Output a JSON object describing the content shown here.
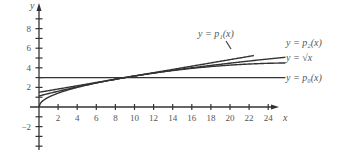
{
  "chart_data": {
    "type": "line",
    "title": "",
    "xlabel": "x",
    "ylabel": "y",
    "xlim": [
      -2,
      26
    ],
    "ylim": [
      -3.5,
      10
    ],
    "x_ticks": [
      2,
      4,
      6,
      8,
      10,
      12,
      14,
      16,
      18,
      20,
      22,
      24
    ],
    "y_ticks": [
      -2,
      2,
      4,
      6,
      8
    ],
    "grid": false,
    "series": [
      {
        "name": "y = p_1(x)",
        "label": "y = p₁(x)",
        "formula": "3 + (x-9)/6",
        "x": [
          0,
          9,
          22.5
        ],
        "values": [
          1.5,
          3,
          5.25
        ]
      },
      {
        "name": "y = p_2(x)",
        "label": "y = p₂(x)",
        "formula": "3 + (x-9)/6 - (x-9)^2/216",
        "x": [
          0,
          4,
          9,
          14,
          19,
          24
        ],
        "values": [
          1.125,
          2.05,
          3,
          3.72,
          4.2,
          4.46
        ]
      },
      {
        "name": "y = sqrt(x)",
        "label": "y = √x",
        "formula": "sqrt(x)",
        "x": [
          0,
          1,
          4,
          9,
          16,
          24
        ],
        "values": [
          0,
          1,
          2,
          3,
          4,
          4.9
        ]
      },
      {
        "name": "y = p_0(x)",
        "label": "y = p₀(x)",
        "formula": "3",
        "x": [
          0,
          24
        ],
        "values": [
          3,
          3
        ]
      }
    ]
  },
  "labels": {
    "p1": "y = p₁(x)",
    "p2": "y = p₂(x)",
    "sqrt": "y = √x",
    "p0": "y = p₀(x)",
    "x_axis": "x",
    "y_axis": "y"
  }
}
